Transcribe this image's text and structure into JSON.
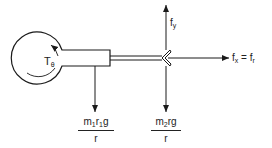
{
  "diagram": {
    "labels": {
      "torque": {
        "base": "T",
        "sub": "θ"
      },
      "fy": {
        "base": "f",
        "sub": "y"
      },
      "fx_equation": {
        "lhs_base": "f",
        "lhs_sub": "x",
        "equals": "=",
        "rhs_base": "f",
        "rhs_sub": "r"
      },
      "left_load": {
        "num_m": "m",
        "num_m_sub": "1",
        "num_r": "r",
        "num_r_sub": "1",
        "num_g": "g",
        "den": "r"
      },
      "right_load": {
        "num_m": "m",
        "num_m_sub": "2",
        "num_rest": "rg",
        "den": "r"
      }
    },
    "colors": {
      "stroke": "#1a1a1a",
      "background": "#ffffff"
    }
  }
}
